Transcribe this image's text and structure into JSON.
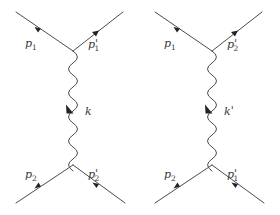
{
  "figure": {
    "background_color": "#ffffff",
    "line_color": "#4a4a52",
    "label_color": "#3a3a42",
    "diagrams": [
      {
        "id": "t-channel",
        "name": "direct-exchange-diagram",
        "propagator_label": "k",
        "propagator_label_prime": "",
        "legs": [
          {
            "name": "incoming-upper",
            "label": "p",
            "subscript": "1",
            "prime": "",
            "direction": "incoming"
          },
          {
            "name": "outgoing-upper",
            "label": "p",
            "subscript": "1",
            "prime": "'",
            "direction": "outgoing"
          },
          {
            "name": "incoming-lower",
            "label": "p",
            "subscript": "2",
            "prime": "",
            "direction": "incoming"
          },
          {
            "name": "outgoing-lower",
            "label": "p",
            "subscript": "2",
            "prime": "'",
            "direction": "outgoing"
          }
        ]
      },
      {
        "id": "u-channel",
        "name": "exchange-diagram",
        "propagator_label": "k",
        "propagator_label_prime": "'",
        "legs": [
          {
            "name": "incoming-upper",
            "label": "p",
            "subscript": "1",
            "prime": "",
            "direction": "incoming"
          },
          {
            "name": "outgoing-upper",
            "label": "p",
            "subscript": "2",
            "prime": "'",
            "direction": "outgoing"
          },
          {
            "name": "incoming-lower",
            "label": "p",
            "subscript": "2",
            "prime": "",
            "direction": "incoming"
          },
          {
            "name": "outgoing-lower",
            "label": "p",
            "subscript": "1",
            "prime": "'",
            "direction": "outgoing"
          }
        ]
      }
    ],
    "labels": {
      "d1_top_left": "p",
      "d1_top_left_sub": "1",
      "d1_top_right": "p",
      "d1_top_right_sub": "1",
      "d1_top_right_prime": "'",
      "d1_bottom_left": "p",
      "d1_bottom_left_sub": "2",
      "d1_bottom_right": "p",
      "d1_bottom_right_sub": "2",
      "d1_bottom_right_prime": "'",
      "d1_propagator": "k",
      "d2_top_left": "p",
      "d2_top_left_sub": "1",
      "d2_top_right": "p",
      "d2_top_right_sub": "2",
      "d2_top_right_prime": "'",
      "d2_bottom_left": "p",
      "d2_bottom_left_sub": "2",
      "d2_bottom_right": "p",
      "d2_bottom_right_sub": "1",
      "d2_bottom_right_prime": "'",
      "d2_propagator": "k",
      "d2_propagator_prime": "'"
    }
  }
}
